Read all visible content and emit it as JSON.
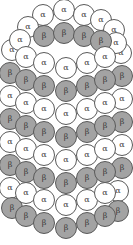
{
  "diagram": {
    "title": "",
    "labels": {
      "alpha": "α",
      "beta": "β"
    },
    "colors": {
      "alpha": "#ffffff",
      "beta": "#a3a3a3",
      "outline": "#5a5a5a"
    },
    "radius": 11,
    "subunits": [
      {
        "t": "alpha",
        "x": 12,
        "y": 50,
        "z": 0
      },
      {
        "t": "alpha",
        "x": 121,
        "y": 53,
        "z": 0
      },
      {
        "t": "beta",
        "x": 10,
        "y": 73,
        "z": 0
      },
      {
        "t": "beta",
        "x": 122,
        "y": 76,
        "z": 0
      },
      {
        "t": "alpha",
        "x": 10,
        "y": 96,
        "z": 0
      },
      {
        "t": "alpha",
        "x": 122,
        "y": 99,
        "z": 0
      },
      {
        "t": "beta",
        "x": 10,
        "y": 119,
        "z": 0
      },
      {
        "t": "beta",
        "x": 122,
        "y": 122,
        "z": 0
      },
      {
        "t": "alpha",
        "x": 10,
        "y": 142,
        "z": 0
      },
      {
        "t": "alpha",
        "x": 122,
        "y": 145,
        "z": 0
      },
      {
        "t": "beta",
        "x": 10,
        "y": 165,
        "z": 0
      },
      {
        "t": "beta",
        "x": 122,
        "y": 168,
        "z": 0
      },
      {
        "t": "alpha",
        "x": 10,
        "y": 188,
        "z": 0
      },
      {
        "t": "alpha",
        "x": 118,
        "y": 191,
        "z": 0
      },
      {
        "t": "beta",
        "x": 12,
        "y": 208,
        "z": 0
      },
      {
        "t": "beta",
        "x": 118,
        "y": 211,
        "z": 0
      },
      {
        "t": "alpha",
        "x": 43,
        "y": 15,
        "z": 1
      },
      {
        "t": "alpha",
        "x": 64,
        "y": 10,
        "z": 1
      },
      {
        "t": "alpha",
        "x": 84,
        "y": 15,
        "z": 1
      },
      {
        "t": "alpha",
        "x": 101,
        "y": 20,
        "z": 1
      },
      {
        "t": "alpha",
        "x": 28,
        "y": 27,
        "z": 1
      },
      {
        "t": "alpha",
        "x": 114,
        "y": 30,
        "z": 1
      },
      {
        "t": "alpha",
        "x": 20,
        "y": 40,
        "z": 1
      },
      {
        "t": "alpha",
        "x": 116,
        "y": 43,
        "z": 1
      },
      {
        "t": "beta",
        "x": 44,
        "y": 36,
        "z": 2
      },
      {
        "t": "beta",
        "x": 64,
        "y": 33,
        "z": 2
      },
      {
        "t": "beta",
        "x": 84,
        "y": 36,
        "z": 2
      },
      {
        "t": "beta",
        "x": 101,
        "y": 41,
        "z": 2
      },
      {
        "t": "alpha",
        "x": 26,
        "y": 57,
        "z": 3
      },
      {
        "t": "alpha",
        "x": 44,
        "y": 63,
        "z": 3
      },
      {
        "t": "alpha",
        "x": 66,
        "y": 68,
        "z": 3
      },
      {
        "t": "alpha",
        "x": 87,
        "y": 63,
        "z": 3
      },
      {
        "t": "alpha",
        "x": 105,
        "y": 57,
        "z": 3
      },
      {
        "t": "beta",
        "x": 26,
        "y": 80,
        "z": 3
      },
      {
        "t": "beta",
        "x": 44,
        "y": 86,
        "z": 3
      },
      {
        "t": "beta",
        "x": 66,
        "y": 91,
        "z": 3
      },
      {
        "t": "beta",
        "x": 87,
        "y": 86,
        "z": 3
      },
      {
        "t": "beta",
        "x": 105,
        "y": 80,
        "z": 3
      },
      {
        "t": "alpha",
        "x": 26,
        "y": 103,
        "z": 4
      },
      {
        "t": "alpha",
        "x": 44,
        "y": 109,
        "z": 4
      },
      {
        "t": "alpha",
        "x": 66,
        "y": 114,
        "z": 4
      },
      {
        "t": "alpha",
        "x": 87,
        "y": 109,
        "z": 4
      },
      {
        "t": "alpha",
        "x": 105,
        "y": 103,
        "z": 4
      },
      {
        "t": "beta",
        "x": 26,
        "y": 126,
        "z": 4
      },
      {
        "t": "beta",
        "x": 44,
        "y": 132,
        "z": 4
      },
      {
        "t": "beta",
        "x": 66,
        "y": 137,
        "z": 4
      },
      {
        "t": "beta",
        "x": 87,
        "y": 132,
        "z": 4
      },
      {
        "t": "beta",
        "x": 105,
        "y": 126,
        "z": 4
      },
      {
        "t": "alpha",
        "x": 26,
        "y": 149,
        "z": 5
      },
      {
        "t": "alpha",
        "x": 44,
        "y": 155,
        "z": 5
      },
      {
        "t": "alpha",
        "x": 66,
        "y": 160,
        "z": 5
      },
      {
        "t": "alpha",
        "x": 87,
        "y": 155,
        "z": 5
      },
      {
        "t": "alpha",
        "x": 105,
        "y": 149,
        "z": 5
      },
      {
        "t": "beta",
        "x": 26,
        "y": 172,
        "z": 5
      },
      {
        "t": "beta",
        "x": 44,
        "y": 178,
        "z": 5
      },
      {
        "t": "beta",
        "x": 66,
        "y": 183,
        "z": 5
      },
      {
        "t": "beta",
        "x": 87,
        "y": 178,
        "z": 5
      },
      {
        "t": "beta",
        "x": 105,
        "y": 172,
        "z": 5
      },
      {
        "t": "alpha",
        "x": 26,
        "y": 193,
        "z": 6
      },
      {
        "t": "alpha",
        "x": 44,
        "y": 200,
        "z": 6
      },
      {
        "t": "alpha",
        "x": 66,
        "y": 205,
        "z": 6
      },
      {
        "t": "alpha",
        "x": 87,
        "y": 200,
        "z": 6
      },
      {
        "t": "alpha",
        "x": 105,
        "y": 193,
        "z": 6
      },
      {
        "t": "beta",
        "x": 26,
        "y": 216,
        "z": 7
      },
      {
        "t": "beta",
        "x": 44,
        "y": 223,
        "z": 7
      },
      {
        "t": "beta",
        "x": 66,
        "y": 228,
        "z": 7
      },
      {
        "t": "beta",
        "x": 87,
        "y": 223,
        "z": 7
      },
      {
        "t": "beta",
        "x": 105,
        "y": 216,
        "z": 7
      }
    ]
  }
}
